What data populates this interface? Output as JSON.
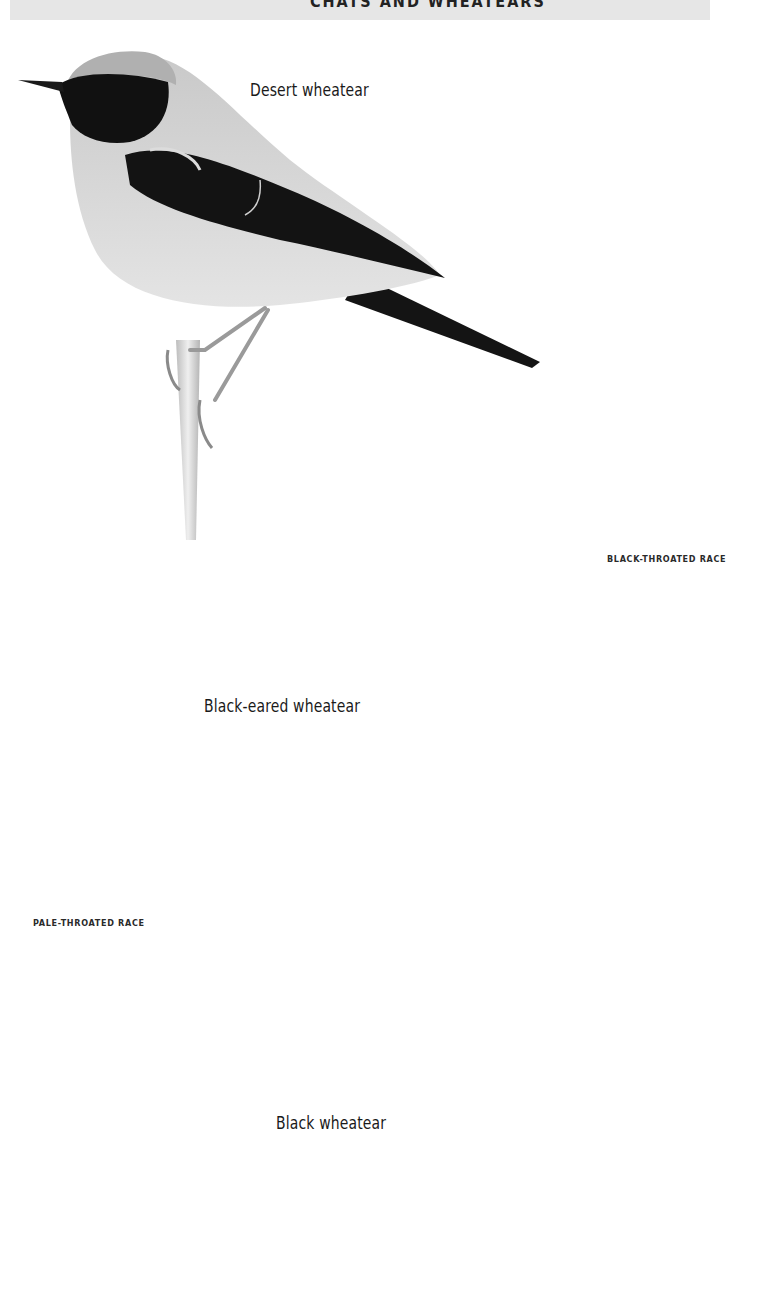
{
  "page": {
    "header": {
      "text": "CHATS AND WHEATEARS",
      "visibility": "cropped at top edge"
    },
    "background_color": "#ffffff",
    "header_strip_color": "#e6e6e6"
  },
  "plates": [
    {
      "id": "desert-wheatear",
      "label": "Desert wheatear",
      "pose": "perched on stem, facing left",
      "plumage": {
        "head": "#b8b8b8",
        "face_throat": "#111111",
        "wing": "#141414",
        "body": "#d6d6d6"
      }
    },
    {
      "id": "black-eared-wheatear-black-throated",
      "label": "BLACK-THROATED RACE",
      "pose": "perched on stem, facing left",
      "plumage": {
        "head": "#eeeeee",
        "face_throat": "#0e0e0e",
        "wing": "#111111",
        "body": "#f3f3f3"
      }
    },
    {
      "id": "black-eared-wheatear-pale-throated",
      "label": "PALE-THROATED RACE",
      "species_label": "Black-eared wheatear",
      "pose": "standing on branch, facing left",
      "plumage": {
        "head": "#f7f7f7",
        "eye_mask": "#111111",
        "wing": "#1a1a1a",
        "body": "#fafafa"
      }
    },
    {
      "id": "black-wheatear",
      "label": "Black wheatear",
      "pose": "standing on ground, facing right",
      "plumage": {
        "body": "#101010",
        "vent": "#f0f0f0",
        "wing_patch": "#ffffff"
      }
    }
  ]
}
